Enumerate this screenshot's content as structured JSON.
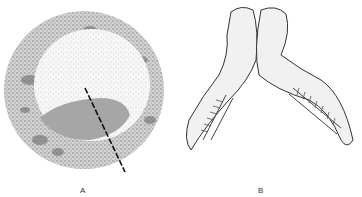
{
  "figure": {
    "panels": [
      {
        "id": "A",
        "label": "A",
        "description": "Circular stippled cross-section with inner disc, shaded lower region and dashed line"
      },
      {
        "id": "B",
        "label": "B",
        "description": "Drawing of two conjoined embryos joined at the head region, with segmented somites"
      }
    ],
    "colors": {
      "background": "#ffffff",
      "stipple_ring": "#9a9a9a",
      "inner_disc": "#f4f4f4",
      "shaded_region": "#a8a8a8",
      "line": "#111111"
    }
  }
}
